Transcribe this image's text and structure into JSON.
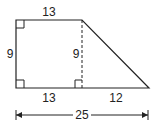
{
  "diagram": {
    "type": "trapezoid",
    "labels": {
      "top": "13",
      "left_height": "9",
      "inner_height": "9",
      "bottom_left": "13",
      "bottom_right": "12",
      "total_width": "25"
    },
    "colors": {
      "stroke": "#222222",
      "background": "#ffffff"
    }
  }
}
